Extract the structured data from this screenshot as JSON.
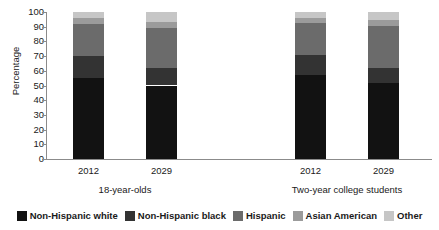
{
  "chart_data": {
    "type": "bar",
    "stacked": true,
    "title": "",
    "subtitle": "",
    "xlabel": "",
    "ylabel": "Percentage",
    "ylim": [
      0,
      100
    ],
    "ytick_labels": [
      "100",
      "90",
      "80",
      "70",
      "60",
      "50",
      "40",
      "30",
      "20",
      "10",
      "0"
    ],
    "ytick_values": [
      100,
      90,
      80,
      70,
      60,
      50,
      40,
      30,
      20,
      10,
      0
    ],
    "grid": false,
    "legend_position": "bottom",
    "categories": [
      "2012",
      "2029",
      "2012",
      "2029"
    ],
    "groups": [
      {
        "label": "18-year-olds",
        "categories": [
          "2012",
          "2029"
        ]
      },
      {
        "label": "Two-year college students",
        "categories": [
          "2012",
          "2029"
        ]
      }
    ],
    "series": [
      {
        "name": "Non-Hispanic white",
        "color": "#121212",
        "values": [
          55.0,
          50.0,
          57.0,
          51.5
        ]
      },
      {
        "name": "Non-Hispanic black",
        "color": "#333333",
        "values": [
          15.0,
          12.0,
          13.5,
          10.5
        ]
      },
      {
        "name": "Hispanic",
        "color": "#6b6b6b",
        "values": [
          21.5,
          27.0,
          22.0,
          28.5
        ]
      },
      {
        "name": "Asian American",
        "color": "#9b9b9b",
        "values": [
          4.5,
          4.5,
          3.5,
          4.0
        ]
      },
      {
        "name": "Other",
        "color": "#c6c6c6",
        "values": [
          4.0,
          6.5,
          4.0,
          5.5
        ]
      }
    ],
    "bars": [
      {
        "group": "18-year-olds",
        "category": "2012",
        "segments": [
          {
            "name": "Non-Hispanic white",
            "value": 55.0,
            "top": 55.0
          },
          {
            "name": "Non-Hispanic black",
            "value": 15.0,
            "top": 70.0
          },
          {
            "name": "Hispanic",
            "value": 21.5,
            "top": 91.5
          },
          {
            "name": "Asian American",
            "value": 4.5,
            "top": 96.0
          },
          {
            "name": "Other",
            "value": 4.0,
            "top": 100.0
          }
        ]
      },
      {
        "group": "18-year-olds",
        "category": "2029",
        "segments": [
          {
            "name": "Non-Hispanic white",
            "value": 50.0,
            "top": 50.0
          },
          {
            "name": "Non-Hispanic black",
            "value": 12.0,
            "top": 62.0
          },
          {
            "name": "Hispanic",
            "value": 27.0,
            "top": 89.0
          },
          {
            "name": "Asian American",
            "value": 4.5,
            "top": 93.5
          },
          {
            "name": "Other",
            "value": 6.5,
            "top": 100.0
          }
        ]
      },
      {
        "group": "Two-year college students",
        "category": "2012",
        "segments": [
          {
            "name": "Non-Hispanic white",
            "value": 57.0,
            "top": 57.0
          },
          {
            "name": "Non-Hispanic black",
            "value": 13.5,
            "top": 70.5
          },
          {
            "name": "Hispanic",
            "value": 22.0,
            "top": 92.5
          },
          {
            "name": "Asian American",
            "value": 3.5,
            "top": 96.0
          },
          {
            "name": "Other",
            "value": 4.0,
            "top": 100.0
          }
        ]
      },
      {
        "group": "Two-year college students",
        "category": "2029",
        "segments": [
          {
            "name": "Non-Hispanic white",
            "value": 51.5,
            "top": 51.5
          },
          {
            "name": "Non-Hispanic black",
            "value": 10.5,
            "top": 62.0
          },
          {
            "name": "Hispanic",
            "value": 28.5,
            "top": 90.5
          },
          {
            "name": "Asian American",
            "value": 4.0,
            "top": 94.5
          },
          {
            "name": "Other",
            "value": 5.5,
            "top": 100.0
          }
        ]
      }
    ],
    "legend": [
      {
        "label": "Non-Hispanic white",
        "color": "#121212"
      },
      {
        "label": "Non-Hispanic black",
        "color": "#333333"
      },
      {
        "label": "Hispanic",
        "color": "#6b6b6b"
      },
      {
        "label": "Asian American",
        "color": "#9b9b9b"
      },
      {
        "label": "Other",
        "color": "#c6c6c6"
      }
    ],
    "axis_color": "#8b8b8b",
    "background_color": "#ffffff",
    "text_color": "#1a1a1a"
  }
}
